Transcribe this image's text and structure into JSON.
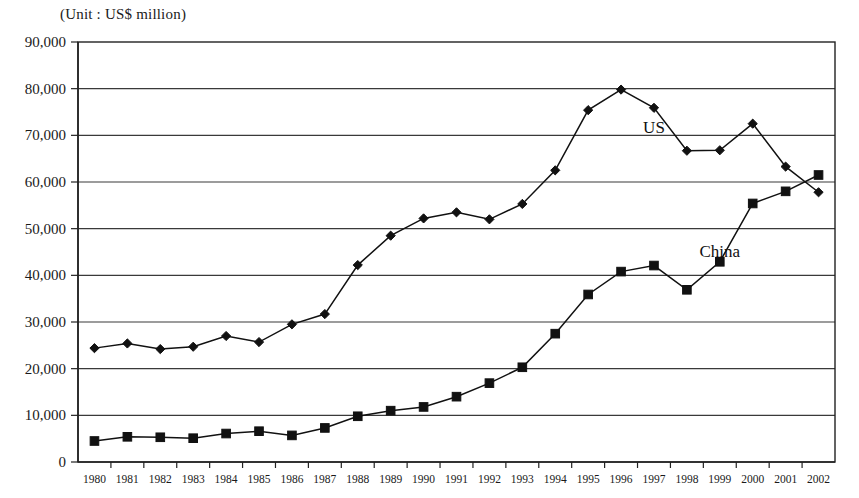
{
  "unit_note": "(Unit : US$ million)",
  "chart_data": {
    "type": "line",
    "title": "",
    "subtitle": "",
    "unit_note": "(Unit : US$ million)",
    "xlabel": "",
    "ylabel": "",
    "ylim": [
      0,
      90000
    ],
    "ytick_step": 10000,
    "grid": true,
    "legend_position": "inline-annotation",
    "categories": [
      "1980",
      "1981",
      "1982",
      "1983",
      "1984",
      "1985",
      "1986",
      "1987",
      "1988",
      "1989",
      "1990",
      "1991",
      "1992",
      "1993",
      "1994",
      "1995",
      "1996",
      "1997",
      "1998",
      "1999",
      "2000",
      "2001",
      "2002"
    ],
    "ytick_labels": [
      "0",
      "10,000",
      "20,000",
      "30,000",
      "40,000",
      "50,000",
      "60,000",
      "70,000",
      "80,000",
      "90,000"
    ],
    "series": [
      {
        "name": "US",
        "marker": "diamond",
        "color": "#111111",
        "label_x_category": "1997",
        "values": [
          24400,
          25400,
          24200,
          24700,
          27000,
          25700,
          29500,
          31700,
          42200,
          48500,
          52200,
          53500,
          52000,
          55300,
          62500,
          75400,
          79800,
          75900,
          66700,
          66800,
          72500,
          63300,
          57800
        ]
      },
      {
        "name": "China",
        "marker": "square",
        "color": "#111111",
        "label_x_category": "1999",
        "values": [
          4500,
          5400,
          5300,
          5100,
          6100,
          6600,
          5700,
          7300,
          9800,
          11000,
          11800,
          14000,
          16900,
          20300,
          27500,
          35900,
          40800,
          42100,
          36900,
          42900,
          55400,
          58000,
          61500
        ]
      }
    ],
    "annotations": [
      {
        "text": "US",
        "near_category": "1997",
        "near_value": 70500
      },
      {
        "text": "China",
        "near_category": "1999",
        "near_value": 44000
      }
    ]
  }
}
